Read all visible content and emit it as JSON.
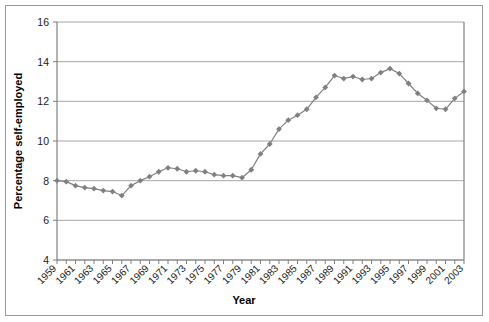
{
  "chart_data": {
    "type": "line",
    "title": "",
    "xlabel": "Year",
    "ylabel": "Percentage self-employed",
    "ylim": [
      4,
      16
    ],
    "ytick_step": 2,
    "yticks": [
      4,
      6,
      8,
      10,
      12,
      14,
      16
    ],
    "grid": true,
    "legend": "none",
    "marker": "diamond",
    "series_color": "#808080",
    "grid_color": "#a6a6a6",
    "axis_color": "#808080",
    "background": "#ffffff",
    "xtick_labels": [
      "1959",
      "1961",
      "1963",
      "1965",
      "1967",
      "1969",
      "1971",
      "1973",
      "1975",
      "1977",
      "1979",
      "1981",
      "1983",
      "1985",
      "1987",
      "1989",
      "1991",
      "1993",
      "1995",
      "1997",
      "1999",
      "2001",
      "2003"
    ],
    "x": [
      1959,
      1960,
      1961,
      1962,
      1963,
      1964,
      1965,
      1966,
      1967,
      1968,
      1969,
      1970,
      1971,
      1972,
      1973,
      1974,
      1975,
      1976,
      1977,
      1978,
      1979,
      1980,
      1981,
      1982,
      1983,
      1984,
      1985,
      1986,
      1987,
      1988,
      1989,
      1990,
      1991,
      1992,
      1993,
      1994,
      1995,
      1996,
      1997,
      1998,
      1999,
      2000,
      2001,
      2002,
      2003
    ],
    "values": [
      8.0,
      7.95,
      7.75,
      7.65,
      7.6,
      7.5,
      7.45,
      7.25,
      7.75,
      8.0,
      8.2,
      8.45,
      8.65,
      8.6,
      8.45,
      8.5,
      8.45,
      8.3,
      8.25,
      8.25,
      8.15,
      8.55,
      9.35,
      9.85,
      10.6,
      11.05,
      11.3,
      11.6,
      12.2,
      12.7,
      13.3,
      13.15,
      13.25,
      13.1,
      13.15,
      13.45,
      13.65,
      13.4,
      12.9,
      12.4,
      12.05,
      11.65,
      11.6,
      12.15,
      12.5
    ]
  }
}
